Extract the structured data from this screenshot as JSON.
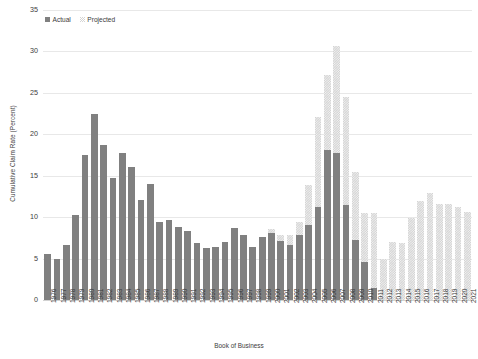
{
  "legend": {
    "position": "top-left",
    "entries": [
      {
        "label": "Actual",
        "color": "#808080"
      },
      {
        "label": "Projected",
        "color": "#d4d4d4"
      }
    ]
  },
  "chart_data": {
    "type": "bar",
    "title": "",
    "subtitle": "",
    "xlabel": "Book of Business",
    "ylabel": "Cumulative Claim Rate (Percent)",
    "ylim": [
      0,
      35
    ],
    "yticks": [
      0,
      5,
      10,
      15,
      20,
      25,
      30,
      35
    ],
    "grid": true,
    "stacked": true,
    "categories": [
      "1976",
      "1977",
      "1978",
      "1979",
      "1980",
      "1981",
      "1982",
      "1983",
      "1984",
      "1985",
      "1986",
      "1987",
      "1988",
      "1989",
      "1990",
      "1991",
      "1992",
      "1993",
      "1994",
      "1995",
      "1996",
      "1997",
      "1998",
      "1999",
      "2000",
      "2001",
      "2002",
      "2003",
      "2004",
      "2005",
      "2006",
      "2007",
      "2008",
      "2009",
      "2010",
      "2011",
      "2012",
      "2013",
      "2014",
      "2015",
      "2016",
      "2017",
      "2018",
      "2019",
      "2020",
      "2021"
    ],
    "series": [
      {
        "name": "Actual",
        "color": "#808080",
        "values": [
          5.6,
          5.0,
          6.6,
          10.3,
          17.5,
          22.4,
          18.7,
          14.7,
          17.8,
          16.1,
          12.1,
          14.0,
          9.4,
          9.7,
          8.8,
          8.3,
          6.9,
          6.3,
          6.4,
          7.0,
          8.7,
          7.9,
          6.4,
          7.6,
          8.1,
          7.1,
          6.7,
          7.9,
          9.0,
          11.2,
          18.1,
          17.8,
          11.5,
          7.2,
          4.6,
          1.5,
          0.0,
          0.0,
          0.0,
          0.0,
          0.0,
          0.0,
          0.0,
          0.0,
          0.0,
          0.0
        ]
      },
      {
        "name": "Projected",
        "color": "#d4d4d4",
        "values": [
          0.0,
          0.0,
          0.0,
          0.0,
          0.0,
          0.0,
          0.0,
          0.0,
          0.0,
          0.0,
          0.0,
          0.0,
          0.0,
          0.0,
          0.0,
          0.0,
          0.0,
          0.0,
          0.0,
          0.0,
          0.0,
          0.0,
          0.0,
          0.0,
          0.5,
          0.8,
          1.2,
          1.5,
          4.9,
          10.9,
          9.1,
          12.8,
          13.0,
          8.2,
          5.9,
          9.0,
          5.0,
          7.0,
          6.9,
          9.9,
          11.9,
          12.9,
          11.6,
          11.6,
          11.2,
          10.6
        ]
      }
    ],
    "totals": [
      5.6,
      5.0,
      6.6,
      10.3,
      17.5,
      22.4,
      18.7,
      14.7,
      17.8,
      16.1,
      12.1,
      14.0,
      9.4,
      9.7,
      8.8,
      8.3,
      6.9,
      6.3,
      6.4,
      7.0,
      8.7,
      7.9,
      6.4,
      7.6,
      8.6,
      7.9,
      7.9,
      9.4,
      13.9,
      22.1,
      27.2,
      30.6,
      24.5,
      15.4,
      10.5,
      10.5,
      5.0,
      7.0,
      6.9,
      9.9,
      11.9,
      12.9,
      11.6,
      11.6,
      11.2,
      10.6
    ]
  }
}
